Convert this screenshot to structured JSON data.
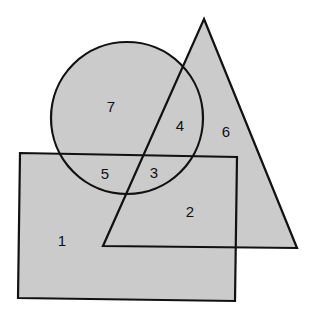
{
  "diagram": {
    "type": "venn-style shape overlap",
    "colors": {
      "fill": "#cbcbcb",
      "stroke": "#111111",
      "background": "#ffffff"
    },
    "shapes": {
      "rectangle": {
        "points": "20,153 237,157 235,301 18,298"
      },
      "triangle": {
        "points": "204,19 297,248 103,246"
      },
      "circle": {
        "cx": 127,
        "cy": 118,
        "r": 76
      }
    },
    "regions": [
      {
        "label": "1",
        "x": 62,
        "y": 240
      },
      {
        "label": "2",
        "x": 190,
        "y": 211
      },
      {
        "label": "3",
        "x": 154,
        "y": 172
      },
      {
        "label": "4",
        "x": 180,
        "y": 125
      },
      {
        "label": "5",
        "x": 105,
        "y": 173
      },
      {
        "label": "6",
        "x": 226,
        "y": 131
      },
      {
        "label": "7",
        "x": 111,
        "y": 106
      }
    ]
  }
}
